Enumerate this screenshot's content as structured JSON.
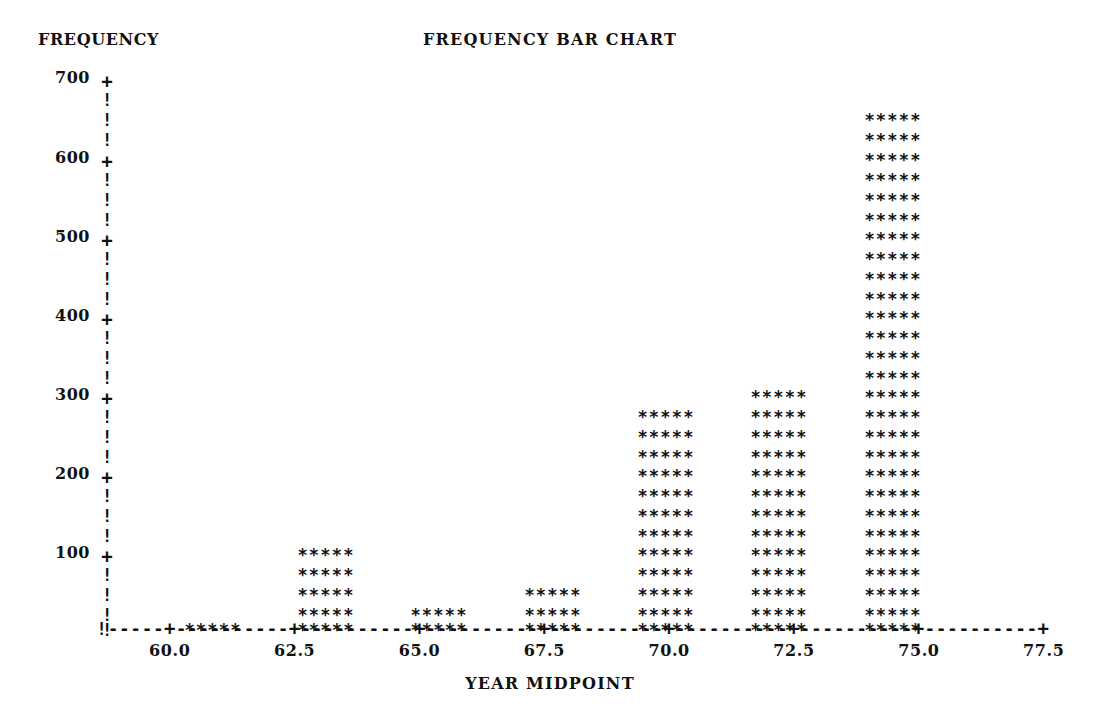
{
  "chart_data": {
    "type": "bar",
    "title": "FREQUENCY BAR CHART",
    "xlabel": "YEAR MIDPOINT",
    "ylabel": "FREQUENCY",
    "categories": [
      "60.0",
      "62.5",
      "65.0",
      "67.5",
      "70.0",
      "72.5",
      "75.0"
    ],
    "values": [
      40,
      140,
      60,
      80,
      320,
      340,
      700
    ],
    "x": [
      60.0,
      62.5,
      65.0,
      67.5,
      70.0,
      72.5,
      75.0
    ],
    "bar_rows": [
      1,
      5,
      2,
      3,
      12,
      13,
      27
    ],
    "row_value_step": 20,
    "bar_glyph": "*****",
    "ylim": [
      0,
      700
    ],
    "xlim": [
      58.75,
      77.5
    ],
    "y_ticks": [
      700,
      600,
      500,
      400,
      300,
      200,
      100
    ],
    "y_tick_labels": [
      "700",
      "600",
      "500",
      "400",
      "300",
      "200",
      "100"
    ],
    "x_ticks": [
      60.0,
      62.5,
      65.0,
      67.5,
      70.0,
      72.5,
      75.0,
      77.5
    ],
    "x_tick_labels": [
      "60.0",
      "62.5",
      "65.0",
      "67.5",
      "70.0",
      "72.5",
      "75.0",
      "77.5"
    ],
    "y_axis_tick_glyph": "+",
    "y_axis_line_glyph": "!",
    "x_axis_tick_glyph": "+",
    "x_axis_line_glyph": "-",
    "x_axis_origin_glyph": "!",
    "grid": false,
    "legend": null,
    "style": "ascii-art-character-plot",
    "ink_color": "#111111",
    "background_color": "#ffffff"
  },
  "axes": {
    "y_rows": [
      {
        "glyph": "+",
        "value": "700",
        "label": "700",
        "top": 72
      },
      {
        "glyph": "!",
        "value": "680",
        "label": "",
        "top": 92
      },
      {
        "glyph": "!",
        "value": "660",
        "label": "",
        "top": 112
      },
      {
        "glyph": "!",
        "value": "640",
        "label": "",
        "top": 132
      },
      {
        "glyph": "+",
        "value": "600",
        "label": "600",
        "top": 152
      },
      {
        "glyph": "!",
        "value": "580",
        "label": "",
        "top": 172
      },
      {
        "glyph": "!",
        "value": "560",
        "label": "",
        "top": 192
      },
      {
        "glyph": "!",
        "value": "540",
        "label": "",
        "top": 212
      },
      {
        "glyph": "+",
        "value": "500",
        "label": "500",
        "top": 231
      },
      {
        "glyph": "!",
        "value": "480",
        "label": "",
        "top": 251
      },
      {
        "glyph": "!",
        "value": "460",
        "label": "",
        "top": 271
      },
      {
        "glyph": "!",
        "value": "440",
        "label": "",
        "top": 291
      },
      {
        "glyph": "+",
        "value": "400",
        "label": "400",
        "top": 310
      },
      {
        "glyph": "!",
        "value": "380",
        "label": "",
        "top": 330
      },
      {
        "glyph": "!",
        "value": "360",
        "label": "",
        "top": 350
      },
      {
        "glyph": "!",
        "value": "340",
        "label": "",
        "top": 370
      },
      {
        "glyph": "+",
        "value": "300",
        "label": "300",
        "top": 389
      },
      {
        "glyph": "!",
        "value": "280",
        "label": "",
        "top": 409
      },
      {
        "glyph": "!",
        "value": "260",
        "label": "",
        "top": 429
      },
      {
        "glyph": "!",
        "value": "240",
        "label": "",
        "top": 449
      },
      {
        "glyph": "+",
        "value": "200",
        "label": "200",
        "top": 468
      },
      {
        "glyph": "!",
        "value": "180",
        "label": "",
        "top": 488
      },
      {
        "glyph": "!",
        "value": "160",
        "label": "",
        "top": 508
      },
      {
        "glyph": "!",
        "value": "140",
        "label": "",
        "top": 528
      },
      {
        "glyph": "+",
        "value": "100",
        "label": "100",
        "top": 547
      },
      {
        "glyph": "!",
        "value": "80",
        "label": "",
        "top": 567
      },
      {
        "glyph": "!",
        "value": "60",
        "label": "",
        "top": 587
      },
      {
        "glyph": "!",
        "value": "40",
        "label": "",
        "top": 607
      },
      {
        "glyph": "!",
        "value": "20",
        "label": "",
        "top": 622
      }
    ],
    "x_segments": [
      {
        "glyph": "!",
        "kind": "origin"
      },
      {
        "glyph": "-",
        "kind": "line"
      },
      {
        "glyph": "-",
        "kind": "line"
      },
      {
        "glyph": "-",
        "kind": "line"
      },
      {
        "glyph": "-",
        "kind": "line"
      },
      {
        "glyph": "-",
        "kind": "line"
      },
      {
        "glyph": "+",
        "kind": "tick",
        "label": "60.0"
      },
      {
        "glyph": "-",
        "kind": "line"
      },
      {
        "glyph": "-",
        "kind": "line"
      },
      {
        "glyph": "-",
        "kind": "line"
      },
      {
        "glyph": "-",
        "kind": "line"
      },
      {
        "glyph": "-",
        "kind": "line"
      },
      {
        "glyph": "-",
        "kind": "line"
      },
      {
        "glyph": "-",
        "kind": "line"
      },
      {
        "glyph": "-",
        "kind": "line"
      },
      {
        "glyph": "-",
        "kind": "line"
      },
      {
        "glyph": "-",
        "kind": "line"
      },
      {
        "glyph": "+",
        "kind": "tick",
        "label": "62.5"
      },
      {
        "glyph": "-",
        "kind": "line"
      },
      {
        "glyph": "-",
        "kind": "line"
      },
      {
        "glyph": "-",
        "kind": "line"
      },
      {
        "glyph": "-",
        "kind": "line"
      },
      {
        "glyph": "-",
        "kind": "line"
      },
      {
        "glyph": "-",
        "kind": "line"
      },
      {
        "glyph": "-",
        "kind": "line"
      },
      {
        "glyph": "-",
        "kind": "line"
      },
      {
        "glyph": "-",
        "kind": "line"
      },
      {
        "glyph": "-",
        "kind": "line"
      },
      {
        "glyph": "+",
        "kind": "tick",
        "label": "65.0"
      },
      {
        "glyph": "-",
        "kind": "line"
      },
      {
        "glyph": "-",
        "kind": "line"
      },
      {
        "glyph": "-",
        "kind": "line"
      },
      {
        "glyph": "-",
        "kind": "line"
      },
      {
        "glyph": "-",
        "kind": "line"
      },
      {
        "glyph": "-",
        "kind": "line"
      },
      {
        "glyph": "-",
        "kind": "line"
      },
      {
        "glyph": "-",
        "kind": "line"
      },
      {
        "glyph": "-",
        "kind": "line"
      },
      {
        "glyph": "-",
        "kind": "line"
      },
      {
        "glyph": "+",
        "kind": "tick",
        "label": "67.5"
      },
      {
        "glyph": "-",
        "kind": "line"
      },
      {
        "glyph": "-",
        "kind": "line"
      },
      {
        "glyph": "-",
        "kind": "line"
      },
      {
        "glyph": "-",
        "kind": "line"
      },
      {
        "glyph": "-",
        "kind": "line"
      },
      {
        "glyph": "-",
        "kind": "line"
      },
      {
        "glyph": "-",
        "kind": "line"
      },
      {
        "glyph": "-",
        "kind": "line"
      },
      {
        "glyph": "-",
        "kind": "line"
      },
      {
        "glyph": "-",
        "kind": "line"
      },
      {
        "glyph": "+",
        "kind": "tick",
        "label": "70.0"
      },
      {
        "glyph": "-",
        "kind": "line"
      },
      {
        "glyph": "-",
        "kind": "line"
      },
      {
        "glyph": "-",
        "kind": "line"
      },
      {
        "glyph": "-",
        "kind": "line"
      },
      {
        "glyph": "-",
        "kind": "line"
      },
      {
        "glyph": "-",
        "kind": "line"
      },
      {
        "glyph": "-",
        "kind": "line"
      },
      {
        "glyph": "-",
        "kind": "line"
      },
      {
        "glyph": "-",
        "kind": "line"
      },
      {
        "glyph": "-",
        "kind": "line"
      },
      {
        "glyph": "+",
        "kind": "tick",
        "label": "72.5"
      },
      {
        "glyph": "-",
        "kind": "line"
      },
      {
        "glyph": "-",
        "kind": "line"
      },
      {
        "glyph": "-",
        "kind": "line"
      },
      {
        "glyph": "-",
        "kind": "line"
      },
      {
        "glyph": "-",
        "kind": "line"
      },
      {
        "glyph": "-",
        "kind": "line"
      },
      {
        "glyph": "-",
        "kind": "line"
      },
      {
        "glyph": "-",
        "kind": "line"
      },
      {
        "glyph": "-",
        "kind": "line"
      },
      {
        "glyph": "-",
        "kind": "line"
      },
      {
        "glyph": "+",
        "kind": "tick",
        "label": "75.0"
      },
      {
        "glyph": "-",
        "kind": "line"
      },
      {
        "glyph": "-",
        "kind": "line"
      },
      {
        "glyph": "-",
        "kind": "line"
      },
      {
        "glyph": "-",
        "kind": "line"
      },
      {
        "glyph": "-",
        "kind": "line"
      },
      {
        "glyph": "-",
        "kind": "line"
      },
      {
        "glyph": "-",
        "kind": "line"
      },
      {
        "glyph": "-",
        "kind": "line"
      },
      {
        "glyph": "-",
        "kind": "line"
      },
      {
        "glyph": "-",
        "kind": "line"
      },
      {
        "glyph": "+",
        "kind": "tick",
        "label": "77.5"
      }
    ],
    "bars": [
      {
        "category": "60.0",
        "value": 40,
        "rows": 1,
        "center_x": 213
      },
      {
        "category": "62.5",
        "value": 140,
        "rows": 5,
        "center_x": 326
      },
      {
        "category": "65.0",
        "value": 60,
        "rows": 2,
        "center_x": 439
      },
      {
        "category": "67.5",
        "value": 80,
        "rows": 3,
        "center_x": 553
      },
      {
        "category": "70.0",
        "value": 320,
        "rows": 12,
        "center_x": 666
      },
      {
        "category": "72.5",
        "value": 340,
        "rows": 13,
        "center_x": 779
      },
      {
        "category": "75.0",
        "value": 700,
        "rows": 27,
        "center_x": 893
      }
    ]
  }
}
